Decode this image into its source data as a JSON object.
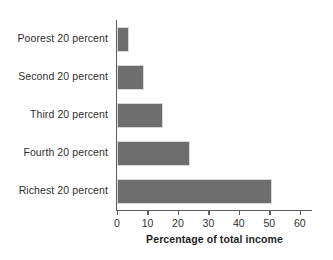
{
  "chart_data": {
    "type": "bar",
    "orientation": "horizontal",
    "title": "",
    "xlabel": "Percentage of total income",
    "ylabel": "",
    "categories": [
      "Poorest 20 percent",
      "Second 20 percent",
      "Third 20 percent",
      "Fourth 20 percent",
      "Richest 20 percent"
    ],
    "values": [
      4,
      9,
      15,
      24,
      51
    ],
    "xlim": [
      0,
      64
    ],
    "xticks": [
      0,
      10,
      20,
      30,
      40,
      50,
      60
    ],
    "xtick_labels": [
      "0",
      "10",
      "20",
      "30",
      "40",
      "50",
      "60"
    ],
    "grid": false,
    "legend": null,
    "bar_color": "#6e6e6e",
    "axis_color": "#5d5d5d",
    "background": "#ffffff"
  }
}
